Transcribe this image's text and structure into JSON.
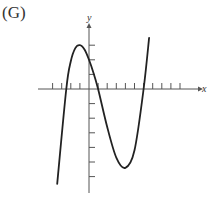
{
  "figure": {
    "label": "(G)"
  },
  "colors": {
    "axis": "#555555",
    "curve": "#222222",
    "background": "#ffffff"
  },
  "chart_data": {
    "type": "line",
    "title": "(G)",
    "xlabel": "x",
    "ylabel": "y",
    "grid": false,
    "x_tick_values": [
      -4,
      -3,
      -2,
      -1,
      1,
      2,
      3,
      4,
      5,
      6,
      7,
      8,
      9,
      10
    ],
    "y_tick_values": [
      3,
      2,
      1,
      -1,
      -2,
      -3,
      -4,
      -5,
      -6
    ],
    "xlim": [
      -5.6,
      12.5
    ],
    "ylim": [
      -7.1,
      4.4
    ],
    "series": [
      {
        "name": "cubic curve",
        "description": "Cubic polynomial with roots near x=-2.5, 1, 6; local max ~(-1, 3); local min ~(4, -5.4); y-intercept ~2",
        "x": [
          -3.5,
          -2.5,
          -2,
          -1.5,
          -1,
          -0.5,
          0,
          0.5,
          1,
          2,
          3,
          4,
          5,
          6,
          6.6
        ],
        "y": [
          -6.5,
          0,
          1.9,
          2.8,
          3.0,
          2.7,
          2.0,
          1.1,
          0,
          -2.6,
          -4.7,
          -5.4,
          -4.2,
          0,
          3.5
        ]
      }
    ]
  }
}
